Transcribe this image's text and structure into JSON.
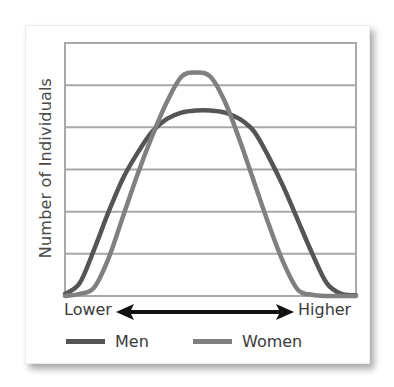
{
  "chart_data": {
    "type": "line",
    "title": "",
    "xlabel": "",
    "ylabel": "Number of Individuals",
    "x_axis_annotation": {
      "left": "Lower",
      "right": "Higher",
      "arrow": "double-headed"
    },
    "grid": true,
    "gridlines_y": [
      1,
      2,
      3,
      4,
      5,
      6
    ],
    "ylim": [
      0,
      6
    ],
    "xlim": [
      0,
      100
    ],
    "legend_position": "bottom",
    "x": [
      0,
      5,
      10,
      15,
      20,
      25,
      30,
      35,
      40,
      45,
      50,
      55,
      60,
      65,
      70,
      75,
      80,
      85,
      90,
      95,
      100
    ],
    "series": [
      {
        "name": "Men",
        "color": "#555555",
        "values": [
          0.05,
          0.3,
          1.1,
          2.0,
          2.8,
          3.4,
          3.9,
          4.2,
          4.35,
          4.4,
          4.4,
          4.35,
          4.2,
          3.9,
          3.3,
          2.6,
          1.8,
          1.0,
          0.3,
          0.05,
          0.02
        ]
      },
      {
        "name": "Women",
        "color": "#808080",
        "values": [
          0.0,
          0.05,
          0.2,
          0.9,
          1.9,
          2.9,
          3.8,
          4.6,
          5.2,
          5.3,
          5.2,
          4.6,
          3.7,
          2.7,
          1.7,
          0.8,
          0.15,
          0.03,
          0.0,
          0.0,
          0.0
        ]
      }
    ]
  },
  "labels": {
    "ylabel": "Number of Individuals",
    "lower": "Lower",
    "higher": "Higher"
  },
  "legend": [
    {
      "label": "Men",
      "color": "#555555"
    },
    {
      "label": "Women",
      "color": "#808080"
    }
  ],
  "colors": {
    "grid": "#a8a8a8",
    "arrow": "#111111",
    "men": "#555555",
    "women": "#808080"
  }
}
